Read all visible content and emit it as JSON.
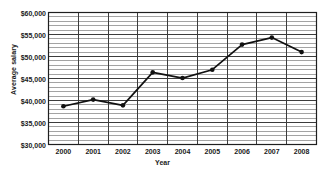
{
  "chart_data": {
    "type": "line",
    "title": "",
    "xlabel": "Year",
    "ylabel": "Average salary",
    "categories": [
      "2000",
      "2001",
      "2002",
      "2003",
      "2004",
      "2005",
      "2006",
      "2007",
      "2008"
    ],
    "x": [
      2000,
      2001,
      2002,
      2003,
      2004,
      2005,
      2006,
      2007,
      2008
    ],
    "values": [
      38700,
      40200,
      38900,
      46400,
      45100,
      47000,
      52700,
      54300,
      51000
    ],
    "series": [
      {
        "name": "Average salary",
        "values": [
          38700,
          40200,
          38900,
          46400,
          45100,
          47000,
          52700,
          54300,
          51000
        ]
      }
    ],
    "ylim": [
      30000,
      60000
    ],
    "ytick_labels": [
      "$60,000",
      "$55,000",
      "$50,000",
      "$45,000",
      "$40,000",
      "$35,000",
      "$30,000"
    ],
    "ytick_values": [
      60000,
      55000,
      50000,
      45000,
      40000,
      35000,
      30000
    ],
    "ytick_step": 5000,
    "yminor_step": 1000,
    "grid": "both",
    "grid_major_color": "#3c3c3c",
    "grid_minor_color": "#8c8c8c",
    "legend": "none",
    "line_color": "#111111",
    "marker": "circle",
    "marker_color": "#111111"
  }
}
